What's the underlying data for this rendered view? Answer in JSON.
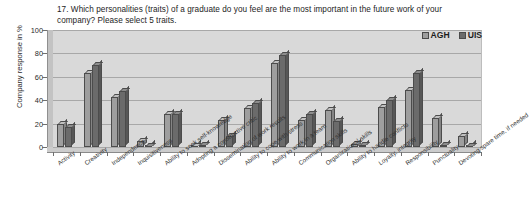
{
  "chart_data": {
    "type": "bar",
    "title": "17. Which personalities  (traits) of a graduate do you feel are the most important in the future work of your company? Please select 5 traits.",
    "xlabel": "",
    "ylabel": "Company response in %",
    "ylim": [
      0,
      100
    ],
    "yticks": [
      0,
      20,
      40,
      60,
      80,
      100
    ],
    "grid": true,
    "legend_position": "top-right",
    "categories": [
      "Activity",
      "Creativity",
      "Independence",
      "Inquisitiveness",
      "Ability to seek self-knowledge",
      "Adopting a constructive critic",
      "Dissemination of work results",
      "Ability to cope with stress",
      "Ability to work in a team",
      "Communication skills",
      "Organizational skills",
      "Ability to handle conflicts",
      "Loyalty, integrity",
      "Responsibility",
      "Punctuality",
      "Devoting spare time, if needed"
    ],
    "series": [
      {
        "name": "AGH",
        "color": "#9e9e9e",
        "values": [
          20,
          63,
          43,
          5,
          28,
          0,
          23,
          33,
          72,
          23,
          32,
          3,
          34,
          49,
          25,
          9
        ]
      },
      {
        "name": "UIS",
        "color": "#6b6b6b",
        "values": [
          17,
          70,
          48,
          1,
          28,
          2,
          9,
          38,
          79,
          28,
          22,
          2,
          40,
          63,
          2,
          1
        ]
      }
    ]
  },
  "legend": {
    "items": [
      {
        "label": "AGH",
        "icon": "legend-swatch"
      },
      {
        "label": "UIS",
        "icon": "legend-swatch"
      }
    ]
  },
  "axis": {
    "y_title": "Company response in %",
    "y_tick_labels": [
      "100",
      "80",
      "60",
      "40",
      "20",
      "0"
    ]
  }
}
